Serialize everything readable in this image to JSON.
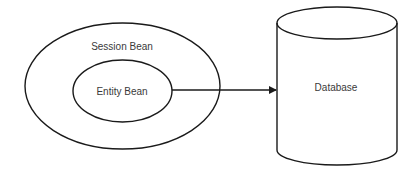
{
  "diagram": {
    "nodes": [
      {
        "id": "session-bean",
        "label": "Session Bean",
        "shape": "ellipse"
      },
      {
        "id": "entity-bean",
        "label": "Entity Bean",
        "shape": "ellipse",
        "contained_in": "session-bean"
      },
      {
        "id": "database",
        "label": "Database",
        "shape": "cylinder"
      }
    ],
    "edges": [
      {
        "from": "entity-bean",
        "to": "database",
        "arrow": "end"
      }
    ]
  },
  "labels": {
    "session_bean": "Session Bean",
    "entity_bean": "Entity Bean",
    "database": "Database"
  },
  "colors": {
    "stroke": "#1a1a1a",
    "text": "#3a3a3a",
    "background": "#ffffff"
  }
}
